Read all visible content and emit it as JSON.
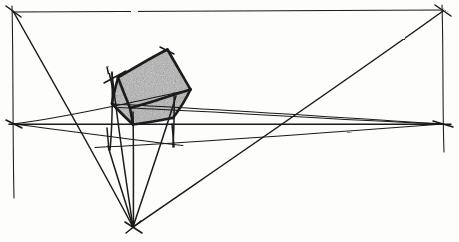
{
  "drawing": {
    "title": "Three-point perspective construction sketch",
    "medium": "pencil on paper",
    "background_color": "#fdfdfc",
    "ink_color": "#1a1a1a",
    "shade_color": "#9a9a9a",
    "shade_color_light": "#a8a8a8",
    "canvas": {
      "width": 459,
      "height": 242
    }
  },
  "vanishing_points": [
    {
      "name": "left-vanishing-point",
      "label": "VPL",
      "x": 13,
      "y": 124
    },
    {
      "name": "right-vanishing-point",
      "label": "VPR",
      "x": 443,
      "y": 124
    },
    {
      "name": "bottom-vanishing-point",
      "label": "VPB",
      "x": 133,
      "y": 227
    },
    {
      "name": "top-left-corner-point",
      "label": "TL",
      "x": 13,
      "y": 11
    },
    {
      "name": "top-right-corner-point",
      "label": "TR",
      "x": 443,
      "y": 11
    }
  ],
  "guide_lines": {
    "horizon_y": 124,
    "top_rule_y": 11,
    "left_vertical_x": 13,
    "right_vertical_x": 443
  },
  "shaded_faces": [
    {
      "name": "top-face",
      "points": "167,50 190,90 130,108 118,78",
      "fill": "#9c9c9c"
    },
    {
      "name": "front-face",
      "points": "118,78 130,108 133,124 112,104",
      "fill": "#a0a0a0"
    },
    {
      "name": "right-face",
      "points": "130,108 190,90 173,118 133,124",
      "fill": "#9a9a9a"
    }
  ],
  "strokes": {
    "box_edges": [
      {
        "name": "box-edge-top-back-left",
        "d": "M 118,77.5 L 167,50"
      },
      {
        "name": "box-edge-top-back-right",
        "d": "M 167,50 L 190.5,89.5"
      },
      {
        "name": "box-edge-top-front-right",
        "d": "M 190.5,89.5 L 130,108"
      },
      {
        "name": "box-edge-top-front-left",
        "d": "M 130,108 L 118,77.5"
      },
      {
        "name": "box-edge-left-vertical",
        "d": "M 112,103.5 L 118,77.5"
      },
      {
        "name": "box-edge-front-diagonal",
        "d": "M 112,103.5 L 133,124.5"
      },
      {
        "name": "box-edge-front-bottom",
        "d": "M 133,124.5 L 130,108"
      },
      {
        "name": "box-edge-right-side",
        "d": "M 190.5,89.5 L 173,118"
      },
      {
        "name": "box-edge-bottom-right",
        "d": "M 173,118 L 133,124.5"
      }
    ],
    "construction_lines": [
      {
        "name": "guide-top-rule",
        "d": "M 13,12 L 443,10"
      },
      {
        "name": "guide-left-vertical",
        "d": "M 12,6 L 14,198"
      },
      {
        "name": "guide-right-vertical",
        "d": "M 442,5 L 444,152"
      },
      {
        "name": "guide-horizon",
        "d": "M 9,124 L 451,124"
      },
      {
        "name": "guide-vpl-to-boxtop",
        "d": "M 13,124 L 190,90"
      },
      {
        "name": "guide-vpl-to-lower",
        "d": "M 13,124 L 181,145"
      },
      {
        "name": "guide-vpr-to-boxleft",
        "d": "M 443,124 L 112,104"
      },
      {
        "name": "guide-vpr-to-lower",
        "d": "M 443,124 L 95,147"
      },
      {
        "name": "guide-vpr-to-upper",
        "d": "M 443,124 L 118,107"
      },
      {
        "name": "guide-diag-tl-to-vpb",
        "d": "M 13,11 L 133,227"
      },
      {
        "name": "guide-diag-vpb-to-tr",
        "d": "M 133,227 L 443,11"
      },
      {
        "name": "guide-vpb-vertical",
        "d": "M 133,227 L 133,112"
      },
      {
        "name": "guide-vpb-to-boxleft",
        "d": "M 133,227 L 112,73"
      },
      {
        "name": "guide-vpb-to-boxright",
        "d": "M 133,227 L 176,96"
      },
      {
        "name": "guide-vpb-to-lower-l",
        "d": "M 133,227 L 108,145"
      },
      {
        "name": "guide-cross-left-top",
        "d": "M 109,94 L 127,69"
      },
      {
        "name": "guide-short-tick-a",
        "d": "M 160,48 L 172,53"
      },
      {
        "name": "guide-short-tick-b",
        "d": "M 103,82 L 124,73"
      }
    ]
  },
  "labels": {
    "none_visible": ""
  }
}
